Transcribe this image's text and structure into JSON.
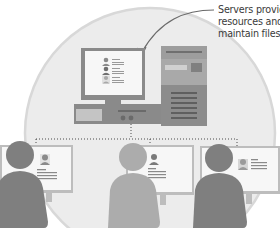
{
  "diagram": {
    "type": "client-server network illustration",
    "caption": {
      "lines": [
        "Servers provide",
        "resources and",
        "maintain files."
      ]
    },
    "server": {
      "label": "server computer (monitor, desktop unit, tower)",
      "monitor_profiles": 3
    },
    "clients": [
      {
        "name": "client-left",
        "shade": "dark"
      },
      {
        "name": "client-center",
        "shade": "light"
      },
      {
        "name": "client-right",
        "shade": "dark"
      }
    ],
    "connection": "dotted network line linking server to three clients",
    "colors": {
      "circle_fill": "#ececec",
      "circle_stroke": "#d6d6d6",
      "dark_gray": "#7f7f7f",
      "mid_gray": "#9a9a9a",
      "light_gray": "#b4b4b4",
      "screen": "#f7f7f7",
      "text": "#3a3a3a"
    }
  }
}
